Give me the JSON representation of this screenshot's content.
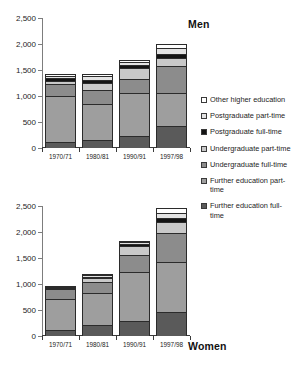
{
  "chart_data": {
    "type": "bar",
    "subtype": "stacked",
    "title": "",
    "panels": [
      {
        "name": "men",
        "title": "Men",
        "title_position": "top-right",
        "xlabel": "",
        "ylabel": "",
        "ylim": [
          0,
          2500
        ],
        "yticks": [
          0,
          500,
          1000,
          1500,
          2000,
          2500
        ],
        "ytick_labels": [
          "0",
          "500",
          "1,000",
          "1,500",
          "2,000",
          "2,500"
        ],
        "grid": false,
        "categories": [
          "1970/71",
          "1980/81",
          "1990/91",
          "1997/98"
        ],
        "series": [
          {
            "name": "Further education full-time",
            "values": [
              110,
              145,
              225,
              420
            ]
          },
          {
            "name": "Further education part-time",
            "values": [
              890,
              700,
              830,
              635
            ]
          },
          {
            "name": "Undergraduate full-time",
            "values": [
              235,
              270,
              280,
              525
            ]
          },
          {
            "name": "Undergraduate part-time",
            "values": [
              55,
              135,
              195,
              145
            ]
          },
          {
            "name": "Postgraduate full-time",
            "values": [
              60,
              60,
              60,
              90
            ]
          },
          {
            "name": "Postgraduate part-time",
            "values": [
              40,
              70,
              60,
              100
            ]
          },
          {
            "name": "Other higher education",
            "values": [
              35,
              40,
              40,
              90
            ]
          }
        ],
        "totals": [
          1425,
          1420,
          1690,
          2005
        ]
      },
      {
        "name": "women",
        "title": "Women",
        "title_position": "bottom-right",
        "xlabel": "",
        "ylabel": "",
        "ylim": [
          0,
          2500
        ],
        "yticks": [
          0,
          500,
          1000,
          1500,
          2000,
          2500
        ],
        "ytick_labels": [
          "0",
          "500",
          "1,000",
          "1,500",
          "2,000",
          "2,500"
        ],
        "grid": false,
        "categories": [
          "1970/71",
          "1980/81",
          "1990/91",
          "1997/98"
        ],
        "series": [
          {
            "name": "Further education full-time",
            "values": [
              110,
              215,
              285,
              465
            ]
          },
          {
            "name": "Further education part-time",
            "values": [
              610,
              610,
              940,
              960
            ]
          },
          {
            "name": "Undergraduate full-time",
            "values": [
              180,
              215,
              335,
              565
            ]
          },
          {
            "name": "Undergraduate part-time",
            "values": [
              20,
              75,
              165,
              200
            ]
          },
          {
            "name": "Postgraduate full-time",
            "values": [
              15,
              25,
              40,
              80
            ]
          },
          {
            "name": "Postgraduate part-time",
            "values": [
              10,
              25,
              35,
              95
            ]
          },
          {
            "name": "Other higher education",
            "values": [
              10,
              20,
              25,
              90
            ]
          }
        ],
        "totals": [
          955,
          1185,
          1825,
          2455
        ]
      }
    ],
    "legend": {
      "position": "right",
      "entries": [
        {
          "label": "Other higher education",
          "color": "#ffffff"
        },
        {
          "label": "Postgraduate part-time",
          "color": "#e3e3e3"
        },
        {
          "label": "Postgraduate full-time",
          "color": "#141414"
        },
        {
          "label": "Undergraduate part-time",
          "color": "#c9c9c9"
        },
        {
          "label": "Undergraduate full-time",
          "color": "#8c8c8c"
        },
        {
          "label": "Further education part-time",
          "color": "#9e9e9e"
        },
        {
          "label": "Further education full-time",
          "color": "#5a5a5a"
        }
      ]
    }
  }
}
